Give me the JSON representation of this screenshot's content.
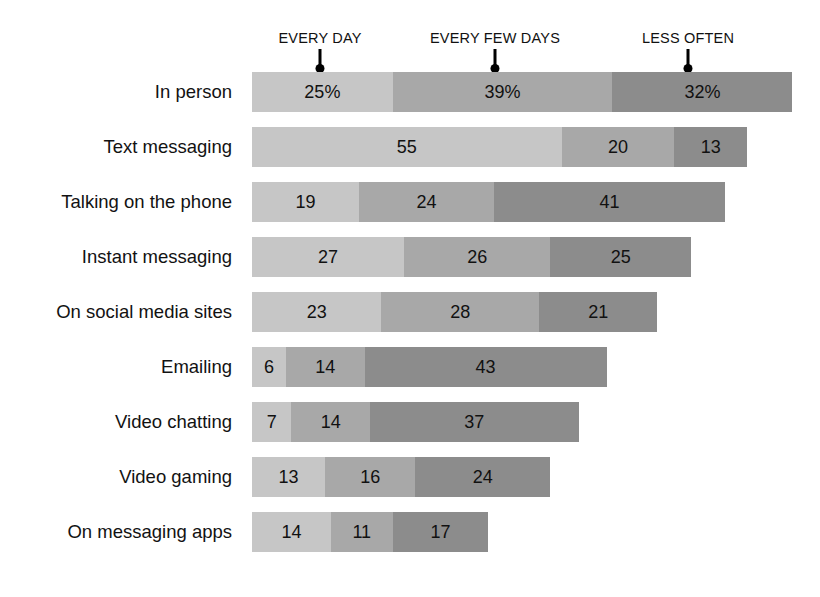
{
  "chart_data": {
    "type": "bar",
    "subtype": "stacked-horizontal-100",
    "title": "",
    "subtitle": "",
    "xlabel": "",
    "ylabel": "",
    "grid": false,
    "legend_position": "top",
    "value_unit": "percent",
    "axis_start_px": 252,
    "px_per_unit": 5.63,
    "legend": [
      {
        "name": "EVERY DAY",
        "color": "#c6c6c6",
        "tick_x": 320
      },
      {
        "name": "EVERY FEW DAYS",
        "color": "#a8a8a8",
        "tick_x": 495
      },
      {
        "name": "LESS OFTEN",
        "color": "#8c8c8c",
        "tick_x": 688
      }
    ],
    "categories": [
      "In person",
      "Text messaging",
      "Talking on the phone",
      "Instant messaging",
      "On social media sites",
      "Emailing",
      "Video chatting",
      "Video gaming",
      "On messaging apps"
    ],
    "series": [
      {
        "name": "EVERY DAY",
        "values": [
          25,
          55,
          19,
          27,
          23,
          6,
          7,
          13,
          14
        ]
      },
      {
        "name": "EVERY FEW DAYS",
        "values": [
          39,
          20,
          24,
          26,
          28,
          14,
          14,
          16,
          11
        ]
      },
      {
        "name": "LESS OFTEN",
        "values": [
          32,
          13,
          41,
          25,
          21,
          43,
          37,
          24,
          17
        ]
      }
    ],
    "data_labels": [
      {
        "category": "In person",
        "labels": [
          "25%",
          "39%",
          "32%"
        ]
      },
      {
        "category": "Text messaging",
        "labels": [
          "55",
          "20",
          "13"
        ]
      },
      {
        "category": "Talking on the phone",
        "labels": [
          "19",
          "24",
          "41"
        ]
      },
      {
        "category": "Instant messaging",
        "labels": [
          "27",
          "26",
          "25"
        ]
      },
      {
        "category": "On social media sites",
        "labels": [
          "23",
          "28",
          "21"
        ]
      },
      {
        "category": "Emailing",
        "labels": [
          "6",
          "14",
          "43"
        ]
      },
      {
        "category": "Video chatting",
        "labels": [
          "7",
          "14",
          "37"
        ]
      },
      {
        "category": "Video gaming",
        "labels": [
          "13",
          "16",
          "24"
        ]
      },
      {
        "category": "On messaging apps",
        "labels": [
          "14",
          "11",
          "17"
        ]
      }
    ]
  }
}
